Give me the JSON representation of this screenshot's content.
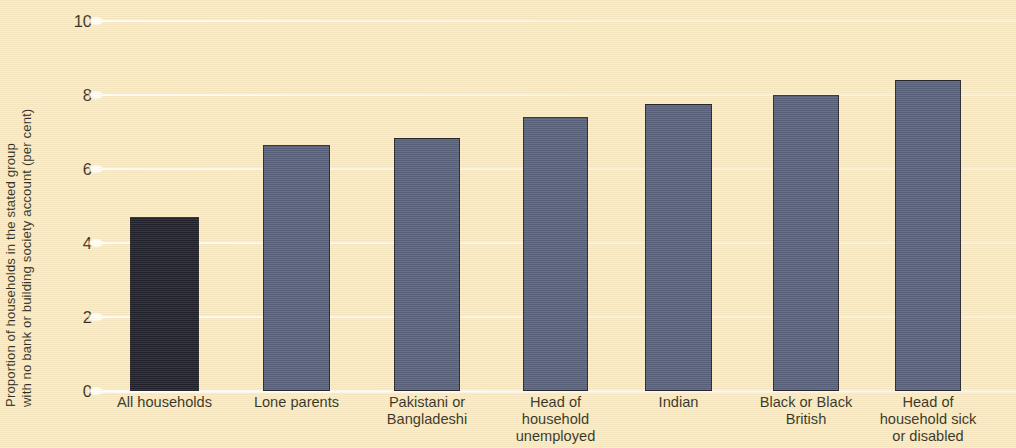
{
  "chart_data": {
    "type": "bar",
    "title": "",
    "subtitle": "",
    "xlabel": "",
    "ylabel": "Proportion of households in the stated group with no bank or building society account (per cent)",
    "ylabel_lines": [
      "Proportion of households in the stated group",
      "with no bank or building society account (per cent)"
    ],
    "categories": [
      "All households",
      "Lone parents",
      "Pakistani or Bangladeshi",
      "Head of household unemployed",
      "Indian",
      "Black or Black British",
      "Head of household sick or disabled"
    ],
    "category_lines": [
      [
        "All households"
      ],
      [
        "Lone parents"
      ],
      [
        "Pakistani or",
        "Bangladeshi"
      ],
      [
        "Head of",
        "household",
        "unemployed"
      ],
      [
        "Indian"
      ],
      [
        "Black or Black",
        "British"
      ],
      [
        "Head of",
        "household sick",
        "or disabled"
      ]
    ],
    "values": [
      4.7,
      6.65,
      6.85,
      7.4,
      7.75,
      8.0,
      8.4
    ],
    "ylim": [
      0,
      10
    ],
    "yticks": [
      0,
      2,
      4,
      6,
      8,
      10
    ],
    "ytick_labels": [
      "0",
      "2",
      "4",
      "6",
      "8",
      "10"
    ],
    "grid": true,
    "grid_axis": "y",
    "legend": false,
    "legend_position": "none",
    "bar_colors": [
      "#0d1020",
      "#4a5475",
      "#4a5475",
      "#4a5475",
      "#4a5475",
      "#4a5475",
      "#4a5475"
    ],
    "bar_edge_color": "#15161f",
    "background_color": "#f7e9c3",
    "gridline_color": "#ffffff",
    "text_color": "#231f16",
    "bar_geometry": [
      {
        "left": 32,
        "width": 69
      },
      {
        "left": 165,
        "width": 67
      },
      {
        "left": 296,
        "width": 66
      },
      {
        "left": 425,
        "width": 65
      },
      {
        "left": 547,
        "width": 67
      },
      {
        "left": 675,
        "width": 66
      },
      {
        "left": 797,
        "width": 66
      }
    ]
  }
}
